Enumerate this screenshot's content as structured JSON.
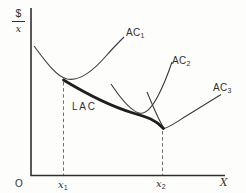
{
  "figure": {
    "background": "#fdfdfb",
    "ink_color": "#2f2f2f",
    "dash_color": "#606060",
    "y_axis": {
      "numerator": "$",
      "denominator": "x"
    },
    "x_axis": {
      "origin": "O",
      "label": "X",
      "ticks": [
        {
          "base": "x",
          "sub": "1"
        },
        {
          "base": "x",
          "sub": "2"
        }
      ]
    },
    "curves": {
      "ac1": {
        "label": "AC",
        "sub": "1",
        "name": "short-run average cost curve 1"
      },
      "ac2": {
        "label": "AC",
        "sub": "2",
        "name": "short-run average cost curve 2"
      },
      "ac3": {
        "label": "AC",
        "sub": "3",
        "name": "short-run average cost curve 3"
      },
      "lac": {
        "label": "LAC",
        "name": "long-run average cost envelope curve"
      }
    }
  }
}
